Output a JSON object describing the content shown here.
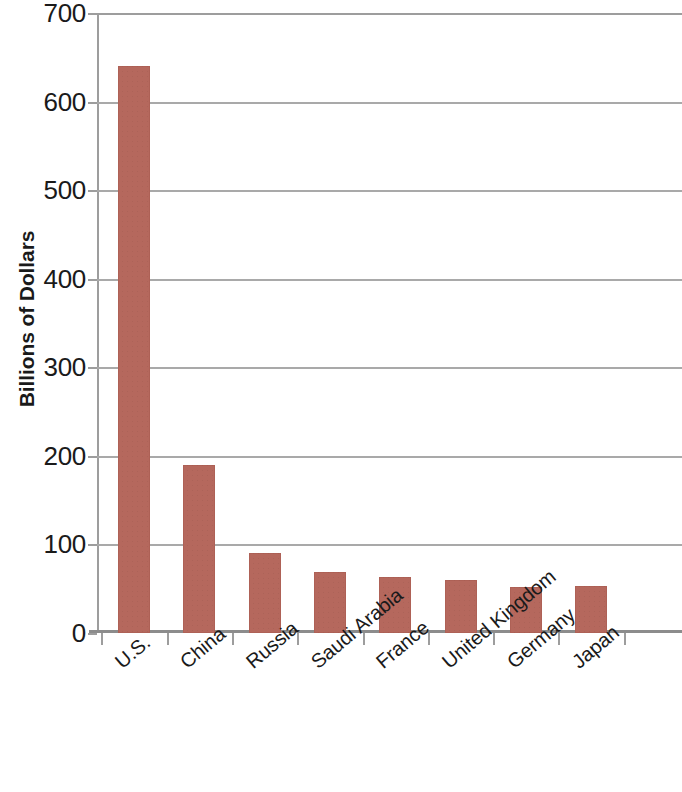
{
  "chart_data": {
    "type": "bar",
    "title": "",
    "xlabel": "",
    "ylabel": "Billions of Dollars",
    "categories": [
      "U.S.",
      "China",
      "Russia",
      "Saudi Arabia",
      "France",
      "United Kingdom",
      "Germany",
      "Japan"
    ],
    "values": [
      640,
      190,
      90,
      69,
      63,
      60,
      52,
      53
    ],
    "ylim": [
      0,
      700
    ],
    "ytick_labels": [
      "0",
      "100",
      "200",
      "300",
      "400",
      "500",
      "600",
      "700"
    ],
    "ytick_values": [
      0,
      100,
      200,
      300,
      400,
      500,
      600,
      700
    ],
    "grid": "horizontal",
    "legend": "none",
    "bar_color": "#b5685d",
    "gridline_color": "#a9a9a9",
    "axis_color": "#8c8c8c",
    "text_color": "#1a1a1a"
  }
}
